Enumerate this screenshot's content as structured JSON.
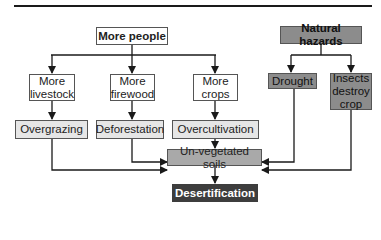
{
  "diagram": {
    "nodes": {
      "more_people": "More people",
      "natural_hazards": "Natural hazards",
      "more_livestock": "More livestock",
      "more_firewood": "More firewood",
      "more_crops": "More crops",
      "drought": "Drought",
      "insects": "Insects destroy crop",
      "overgrazing": "Overgrazing",
      "deforestation": "Deforestation",
      "overcultivation": "Overcultivation",
      "unvegetated": "Un-vegetated soils",
      "desertification": "Desertification"
    },
    "edges": [
      {
        "from": "More people",
        "to": "More livestock"
      },
      {
        "from": "More people",
        "to": "More firewood"
      },
      {
        "from": "More people",
        "to": "More crops"
      },
      {
        "from": "Natural hazards",
        "to": "Drought"
      },
      {
        "from": "Natural hazards",
        "to": "Insects destroy crop"
      },
      {
        "from": "More livestock",
        "to": "Overgrazing"
      },
      {
        "from": "More firewood",
        "to": "Deforestation"
      },
      {
        "from": "More crops",
        "to": "Overcultivation"
      },
      {
        "from": "Overgrazing",
        "to": "Un-vegetated soils"
      },
      {
        "from": "Deforestation",
        "to": "Un-vegetated soils"
      },
      {
        "from": "Overcultivation",
        "to": "Un-vegetated soils"
      },
      {
        "from": "Drought",
        "to": "Un-vegetated soils"
      },
      {
        "from": "Insects destroy crop",
        "to": "Un-vegetated soils"
      },
      {
        "from": "Un-vegetated soils",
        "to": "Desertification"
      }
    ],
    "colors": {
      "white_box": "#ffffff",
      "light_box": "#e6e6e6",
      "mid_box": "#a9a9a9",
      "hazard_box": "#8c8c8c",
      "outcome_box": "#3d3d3d",
      "line": "#1a1a1a"
    }
  }
}
